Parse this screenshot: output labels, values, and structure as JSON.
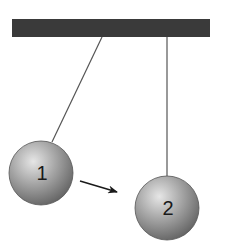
{
  "diagram": {
    "title": "",
    "support_bar": {
      "color": "#3a3a3a"
    },
    "balls": [
      {
        "label": "1",
        "color": "#8e8e8e"
      },
      {
        "label": "2",
        "color": "#8e8e8e"
      }
    ],
    "arrow": {
      "from": "1",
      "to": "2",
      "color": "#1a1a1a"
    }
  }
}
